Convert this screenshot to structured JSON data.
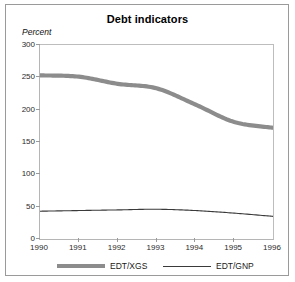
{
  "figure": {
    "title": "Debt indicators",
    "unit_label": "Percent"
  },
  "legend": {
    "items": [
      {
        "label": "EDT/XGS",
        "style": "thick",
        "color": "#8c8c8c"
      },
      {
        "label": "EDT/GNP",
        "style": "thin",
        "color": "#3a3a3a"
      }
    ]
  },
  "chart_data": {
    "type": "line",
    "title": "Debt indicators",
    "xlabel": "",
    "ylabel": "Percent",
    "x": [
      1990,
      1991,
      1992,
      1993,
      1994,
      1995,
      1996
    ],
    "categories": [
      "1990",
      "1991",
      "1992",
      "1993",
      "1994",
      "1995",
      "1996"
    ],
    "xlim": [
      1990,
      1996
    ],
    "ylim": [
      0,
      300
    ],
    "yticks": [
      0,
      50,
      100,
      150,
      200,
      250,
      300
    ],
    "xticks": [
      1990,
      1991,
      1992,
      1993,
      1994,
      1995,
      1996
    ],
    "grid": false,
    "legend_position": "bottom",
    "series": [
      {
        "name": "EDT/XGS",
        "color": "#8c8c8c",
        "linewidth": "thick",
        "values": [
          253,
          251,
          240,
          233,
          208,
          181,
          172
        ]
      },
      {
        "name": "EDT/GNP",
        "color": "#3a3a3a",
        "linewidth": "thin",
        "values": [
          43,
          44,
          45,
          46,
          44,
          40,
          35
        ]
      }
    ]
  }
}
